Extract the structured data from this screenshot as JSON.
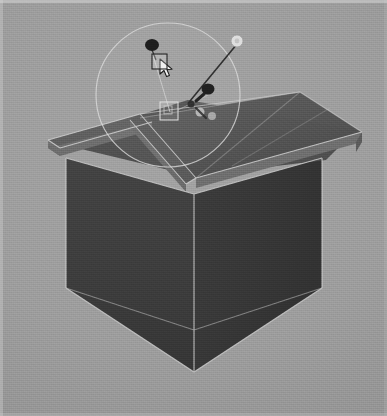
{
  "app": {
    "title": "3D Modeling Viewport",
    "view_label": "Perspective",
    "canvas_width": 387,
    "canvas_height": 416
  },
  "colors": {
    "background": "#9b9b9b",
    "background_light": "#a2a2a2",
    "background_dark": "#8d8d8d",
    "wall_front_left": "#3a3a3a",
    "wall_front_right": "#343434",
    "wall_interior": "#3c3c3c",
    "floor_interior": "#3a3a3a",
    "roof_near": "#565656",
    "roof_far": "#4e4e4e",
    "roof_gable_face": "#5e5e5e",
    "roof_fascia": "#6b6b6b",
    "edge_highlight": "#c9c9c9",
    "gizmo_circle": "#d5d5d5",
    "handle_fill": "#d8d8d8",
    "handle_line": "#3b3b3b",
    "marker_dark": "#1e1e1e",
    "cursor_fill": "#f2f2f2",
    "cursor_stroke": "#1a1a1a"
  },
  "scene": {
    "model_name": "house-model",
    "geometry_type": "gabled-house",
    "transparency": "translucent-walls"
  },
  "gizmo": {
    "name": "orbit-rotation-circle",
    "center_x": 168,
    "center_y": 95,
    "radius": 72,
    "handles": [
      {
        "id": "handle-top-left-marker",
        "x": 152,
        "y": 45,
        "r": 6.5,
        "kind": "dark-marker"
      },
      {
        "id": "handle-mid-marker",
        "x": 208,
        "y": 89,
        "r": 6.0,
        "kind": "dark-marker"
      },
      {
        "id": "handle-rotate-knob",
        "x": 237,
        "y": 41,
        "r": 5.5,
        "kind": "light-knob"
      }
    ],
    "leader_lines": [
      {
        "id": "leader-to-roof-a",
        "x1": 152,
        "y1": 52,
        "x2": 170,
        "y2": 112
      },
      {
        "id": "leader-to-roof-b",
        "x1": 237,
        "y1": 44,
        "x2": 192,
        "y2": 100
      },
      {
        "id": "leader-to-roof-c",
        "x1": 208,
        "y1": 95,
        "x2": 178,
        "y2": 110
      }
    ],
    "selection_square": {
      "x": 160,
      "y": 102,
      "size": 18
    }
  },
  "cursor": {
    "name": "arrow-pointer",
    "x": 158,
    "y": 58,
    "tool": "select"
  },
  "markers": [
    {
      "id": "anchor-point-1",
      "x": 200,
      "y": 112,
      "r": 4.5,
      "fill": "#c6c6c6"
    },
    {
      "id": "anchor-point-2",
      "x": 212,
      "y": 116,
      "r": 4.0,
      "fill": "#b9b9b9"
    },
    {
      "id": "anchor-point-3",
      "x": 191,
      "y": 104,
      "r": 3.5,
      "fill": "#2a2a2a"
    }
  ],
  "status": {
    "visible": false,
    "text": ""
  }
}
